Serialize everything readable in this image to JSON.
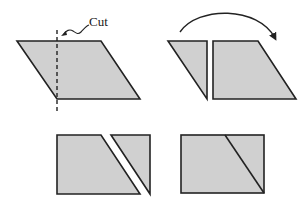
{
  "diagram": {
    "cut_label": "Cut",
    "colors": {
      "fill": "#d0d0d0",
      "stroke": "#222222",
      "background": "#ffffff"
    },
    "panels": [
      {
        "id": "step-1",
        "description": "Parallelogram with dashed vertical cut line"
      },
      {
        "id": "step-2",
        "description": "Triangle separated; curved arrow shows moving it to the right side"
      },
      {
        "id": "step-3",
        "description": "Triangle placed on the right of the trapezoid with a gap"
      },
      {
        "id": "step-4",
        "description": "Pieces joined to form a rectangle"
      }
    ]
  }
}
